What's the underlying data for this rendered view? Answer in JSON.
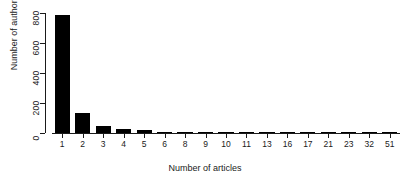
{
  "chart_data": {
    "type": "bar",
    "title": "",
    "xlabel": "Number of articles",
    "ylabel": "Number of authors",
    "categories": [
      "1",
      "2",
      "3",
      "4",
      "5",
      "6",
      "8",
      "9",
      "10",
      "11",
      "13",
      "16",
      "17",
      "21",
      "23",
      "32",
      "51"
    ],
    "values": [
      790,
      133,
      47,
      27,
      20,
      10,
      8,
      8,
      8,
      8,
      8,
      6,
      6,
      6,
      10,
      6,
      6
    ],
    "ylim": [
      0,
      800
    ],
    "ytick_values": [
      0,
      200,
      400,
      600,
      800
    ],
    "ytick_labels": [
      "0",
      "200",
      "400",
      "600",
      "800"
    ],
    "grid": false,
    "legend": false,
    "bar_color": "#000000",
    "axis_color": "#1a1a1a"
  }
}
